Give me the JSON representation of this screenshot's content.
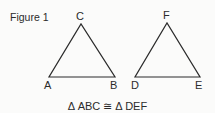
{
  "figure": {
    "title": "Figure 1",
    "caption": "Δ ABC ≅ Δ DEF"
  },
  "triangles": [
    {
      "name": "ABC",
      "vertices": {
        "A": {
          "label": "A",
          "x": 49,
          "y": 77
        },
        "B": {
          "label": "B",
          "x": 115,
          "y": 77
        },
        "C": {
          "label": "C",
          "x": 81,
          "y": 24
        }
      }
    },
    {
      "name": "DEF",
      "vertices": {
        "D": {
          "label": "D",
          "x": 135,
          "y": 77
        },
        "E": {
          "label": "E",
          "x": 200,
          "y": 77
        },
        "F": {
          "label": "F",
          "x": 167,
          "y": 23
        }
      }
    }
  ],
  "colors": {
    "stroke": "#2b2b2b",
    "background": "#fbfbfa"
  }
}
